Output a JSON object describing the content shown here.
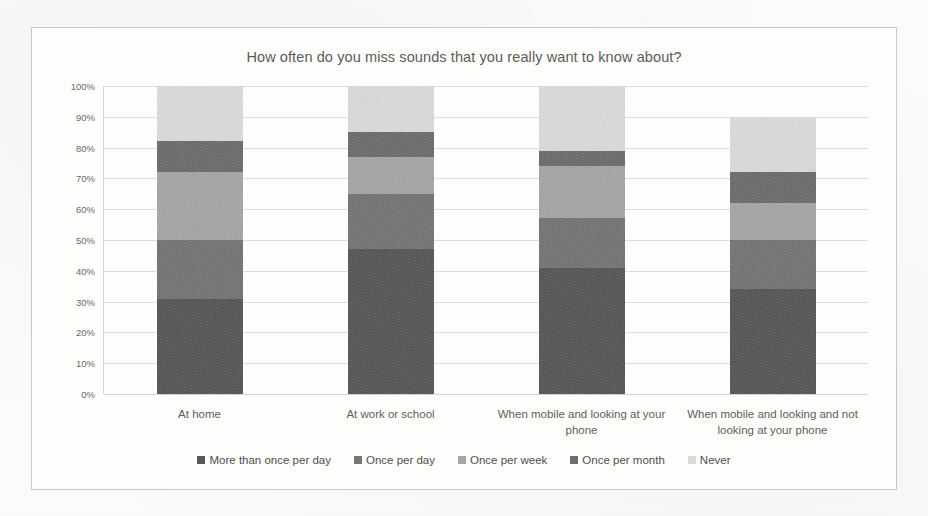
{
  "chart_data": {
    "type": "bar",
    "subtype": "stacked-bar-100-percent",
    "title": "How often do you miss sounds that you really want to know about?",
    "xlabel": "",
    "ylabel": "",
    "ylim": [
      0,
      100
    ],
    "ytick_labels": [
      "100%",
      "90%",
      "80%",
      "70%",
      "60%",
      "50%",
      "40%",
      "30%",
      "20%",
      "10%",
      "0%"
    ],
    "ytick_values": [
      100,
      90,
      80,
      70,
      60,
      50,
      40,
      30,
      20,
      10,
      0
    ],
    "grid": true,
    "legend_position": "bottom",
    "categories": [
      "At home",
      "At work or school",
      "When mobile and looking at your phone",
      "When mobile and looking and not looking at your phone"
    ],
    "series": [
      {
        "name": "More than once per day",
        "color": "#595959",
        "values": [
          31,
          47,
          41,
          34
        ]
      },
      {
        "name": "Once per day",
        "color": "#767676",
        "values": [
          19,
          18,
          16,
          16
        ]
      },
      {
        "name": "Once per week",
        "color": "#a6a6a6",
        "values": [
          22,
          12,
          17,
          12
        ]
      },
      {
        "name": "Once per month",
        "color": "#6e6e6e",
        "values": [
          10,
          8,
          5,
          10
        ]
      },
      {
        "name": "Never",
        "color": "#d9d9d9",
        "values": [
          18,
          15,
          21,
          18
        ]
      }
    ]
  }
}
